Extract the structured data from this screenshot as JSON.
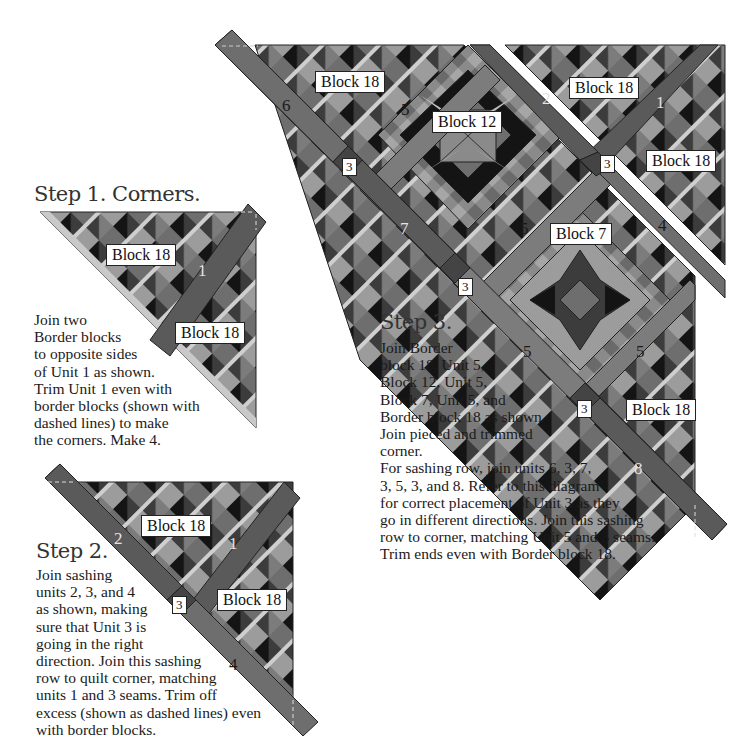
{
  "colors": {
    "background": "#ffffff",
    "sashing_dark": "#5a5a5a",
    "sashing_mid": "#7c7c7c",
    "block_black": "#141414",
    "block_dark": "#3c3c3c",
    "block_mid": "#6e6e6e",
    "block_light": "#9c9c9c",
    "block_pale": "#bdbdbd",
    "strip_light": "#d0d0d0",
    "label_bg": "#ffffff"
  },
  "step1": {
    "title": "Step 1. Corners.",
    "lines": [
      "Join two",
      "Border blocks",
      "to opposite sides",
      "of Unit 1 as shown.",
      "Trim Unit 1 even with",
      "border blocks (shown with",
      "dashed lines) to make",
      "the corners.  Make 4."
    ],
    "labels": {
      "block_top": "Block 18",
      "block_bottom": "Block 18",
      "unit": "1"
    }
  },
  "step2": {
    "title": "Step 2.",
    "lines": [
      "Join sashing",
      "units 2, 3, and 4",
      "as shown, making",
      "sure that Unit 3 is",
      "going in the right",
      "direction.  Join this sashing",
      "row to quilt corner, matching",
      "units 1 and 3 seams.  Trim off",
      "excess (shown as dashed lines) even",
      "with border blocks."
    ],
    "labels": {
      "block_top": "Block 18",
      "block_bottom": "Block 18",
      "unit_1": "1",
      "unit_2": "2",
      "unit_3": "3",
      "unit_4": "4"
    }
  },
  "step3": {
    "title": "Step 3.",
    "lines": [
      "Join Border",
      "block 18, Unit 5,",
      "Block 12, Unit 5,",
      "Block 7, Unit 5, and",
      "Border block 18 as shown.",
      "Join pieced and trimmed",
      "corner.",
      "For sashing row, join units 6, 3, 7,",
      "3, 5, 3, and 8.  Refer to this diagram",
      "for correct placement of Unit 3 as they",
      "go in different directions.  Join this sashing",
      "row to corner, matching Unit 5 and 3 seams.",
      "Trim ends even with Border block 18."
    ],
    "labels": {
      "block_18_top": "Block 18",
      "block_12": "Block 12",
      "block_7": "Block 7",
      "block_18_bottom": "Block 18",
      "unit_6": "6",
      "unit_3a": "3",
      "unit_7": "7",
      "unit_3b": "3",
      "unit_5a": "5",
      "unit_5b": "5",
      "unit_5c": "5",
      "unit_5d": "5",
      "unit_3c": "3",
      "unit_8": "8"
    }
  },
  "corner_piece": {
    "labels": {
      "block_top": "Block 18",
      "block_bottom": "Block 18",
      "unit_1": "1",
      "unit_2": "2",
      "unit_3": "3",
      "unit_4": "4"
    }
  }
}
